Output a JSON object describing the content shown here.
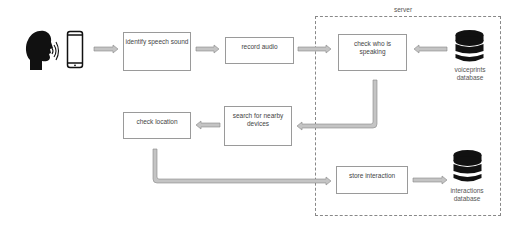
{
  "diagram": {
    "type": "flowchart",
    "actors": {
      "speaker": {
        "icon": "speaking-head-icon"
      },
      "device": {
        "icon": "smartphone-icon"
      }
    },
    "container": {
      "label": "server"
    },
    "nodes": [
      {
        "id": "identify",
        "label": "identify speech sound"
      },
      {
        "id": "record",
        "label": "record audio"
      },
      {
        "id": "check_who",
        "label": "check who is speaking"
      },
      {
        "id": "search",
        "label": "search for nearby devices"
      },
      {
        "id": "check_location",
        "label": "check location"
      },
      {
        "id": "store",
        "label": "store interaction"
      }
    ],
    "databases": [
      {
        "id": "voiceprints",
        "label_line1": "voiceprints",
        "label_line2": "database",
        "icon": "database-icon"
      },
      {
        "id": "interactions",
        "label_line1": "interactions",
        "label_line2": "database",
        "icon": "database-icon"
      }
    ],
    "edges": [
      {
        "from": "device",
        "to": "identify"
      },
      {
        "from": "identify",
        "to": "record"
      },
      {
        "from": "record",
        "to": "check_who"
      },
      {
        "from": "voiceprints",
        "to": "check_who"
      },
      {
        "from": "check_who",
        "to": "search"
      },
      {
        "from": "search",
        "to": "check_location"
      },
      {
        "from": "check_location",
        "to": "store"
      },
      {
        "from": "store",
        "to": "interactions"
      }
    ],
    "colors": {
      "arrow": "#b5b5b5",
      "box_border": "#9a9a9a",
      "icon": "#111111"
    }
  }
}
